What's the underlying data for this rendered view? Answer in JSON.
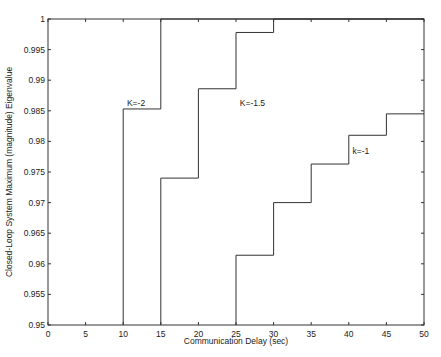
{
  "chart_data": {
    "type": "line",
    "title": "",
    "xlabel": "Communication Delay (sec)",
    "ylabel": "Closed-Loop System Maximum (magnitude) Eigenvalue",
    "xlim": [
      0,
      50
    ],
    "ylim": [
      0.95,
      1.0
    ],
    "grid": false,
    "legend": "none (inline curve labels)",
    "x_ticks": [
      "0",
      "5",
      "10",
      "15",
      "20",
      "25",
      "30",
      "35",
      "40",
      "45",
      "50"
    ],
    "y_ticks": [
      "0.95",
      "0.955",
      "0.96",
      "0.965",
      "0.97",
      "0.975",
      "0.98",
      "0.985",
      "0.99",
      "0.995",
      "1"
    ],
    "series": [
      {
        "name": "K=-2",
        "step": true,
        "x": [
          10,
          15,
          50
        ],
        "y": [
          0.9853,
          1.0,
          1.0
        ]
      },
      {
        "name": "K=-1.5",
        "step": true,
        "x": [
          15,
          20,
          25,
          30,
          50
        ],
        "y": [
          0.974,
          0.9886,
          0.9978,
          1.0,
          1.0
        ]
      },
      {
        "name": "k=-1",
        "step": true,
        "x": [
          25,
          30,
          35,
          40,
          45,
          50
        ],
        "y": [
          0.9614,
          0.97,
          0.9763,
          0.981,
          0.9845,
          0.9845
        ]
      }
    ],
    "annotations": [
      {
        "text": "K=-2",
        "x": 10.5,
        "y": 0.9858
      },
      {
        "text": "K=-1.5",
        "x": 25.5,
        "y": 0.9858
      },
      {
        "text": "k=-1",
        "x": 40.5,
        "y": 0.978
      }
    ]
  }
}
